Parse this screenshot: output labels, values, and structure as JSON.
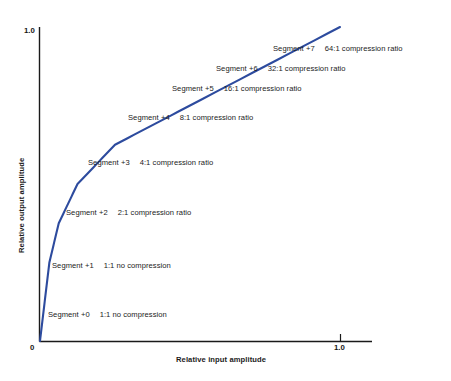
{
  "chart_data": {
    "type": "line",
    "title": "",
    "xlabel": "Relative input amplitude",
    "ylabel": "Relative output amplitude",
    "xlim": [
      0,
      1.1
    ],
    "ylim": [
      0,
      1.05
    ],
    "xticks": [
      "0",
      "1.0"
    ],
    "yticks": [
      "1.0"
    ],
    "grid": false,
    "legend": "none",
    "line_color": "#2d4b9e",
    "axis_color": "#1a1a1a",
    "series": [
      {
        "name": "Companding curve (segmented A-law / mu-law)",
        "x": [
          0.0,
          0.0156,
          0.0312,
          0.0625,
          0.125,
          0.25,
          0.5,
          1.0
        ],
        "y": [
          0.0,
          0.125,
          0.25,
          0.375,
          0.5,
          0.625,
          0.75,
          1.0
        ]
      }
    ],
    "annotations": [
      {
        "segment": "Segment +7",
        "ratio": "64:1 compression ratio"
      },
      {
        "segment": "Segment +6",
        "ratio": "32:1 compression ratio"
      },
      {
        "segment": "Segment +5",
        "ratio": "16:1 compression ratio"
      },
      {
        "segment": "Segment +4",
        "ratio": "8:1 compression ratio"
      },
      {
        "segment": "Segment +3",
        "ratio": "4:1 compression ratio"
      },
      {
        "segment": "Segment +2",
        "ratio": "2:1 compression ratio"
      },
      {
        "segment": "Segment +1",
        "ratio": "1:1  no compression"
      },
      {
        "segment": "Segment +0",
        "ratio": "1:1 no compression"
      }
    ]
  },
  "axes": {
    "y_top_tick": "1.0",
    "origin_tick": "0",
    "x_right_tick": "1.0",
    "x_title": "Relative input amplitude",
    "y_title": "Relative output amplitude"
  }
}
